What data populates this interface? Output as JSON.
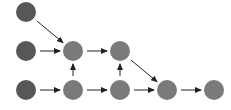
{
  "diagram": {
    "type": "directed-graph",
    "width": 231,
    "height": 110,
    "colors": {
      "input_node": "#575757",
      "hidden_node": "#7a7a7a",
      "edge": "#222222",
      "background": "#ffffff"
    },
    "node_radius": 10,
    "nodes": [
      {
        "id": "n1",
        "x": 26,
        "y": 12,
        "kind": "input_node"
      },
      {
        "id": "n2",
        "x": 26,
        "y": 51,
        "kind": "input_node"
      },
      {
        "id": "n3",
        "x": 73,
        "y": 51,
        "kind": "hidden_node"
      },
      {
        "id": "n4",
        "x": 120,
        "y": 51,
        "kind": "hidden_node"
      },
      {
        "id": "n5",
        "x": 26,
        "y": 90,
        "kind": "input_node"
      },
      {
        "id": "n6",
        "x": 73,
        "y": 90,
        "kind": "hidden_node"
      },
      {
        "id": "n7",
        "x": 120,
        "y": 90,
        "kind": "hidden_node"
      },
      {
        "id": "n8",
        "x": 167,
        "y": 90,
        "kind": "hidden_node"
      },
      {
        "id": "n9",
        "x": 214,
        "y": 90,
        "kind": "hidden_node"
      }
    ],
    "edges": [
      {
        "from": "n1",
        "to": "n3"
      },
      {
        "from": "n2",
        "to": "n3"
      },
      {
        "from": "n3",
        "to": "n4"
      },
      {
        "from": "n6",
        "to": "n3"
      },
      {
        "from": "n7",
        "to": "n4"
      },
      {
        "from": "n4",
        "to": "n8"
      },
      {
        "from": "n5",
        "to": "n6"
      },
      {
        "from": "n6",
        "to": "n7"
      },
      {
        "from": "n7",
        "to": "n8"
      },
      {
        "from": "n8",
        "to": "n9"
      }
    ]
  }
}
